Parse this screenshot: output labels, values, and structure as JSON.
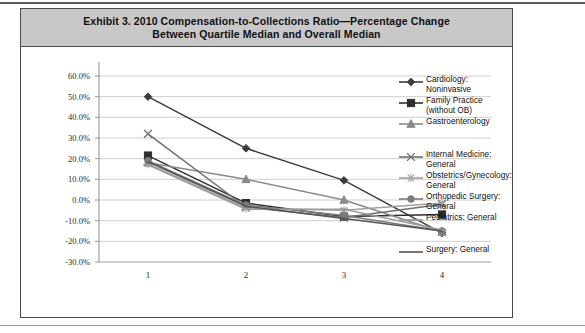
{
  "exhibit": {
    "title": "Exhibit 3. 2010 Compensation-to-Collections Ratio—Percentage Change Between Quartile Median and Overall Median",
    "title_line1": "Exhibit 3. 2010 Compensation-to-Collections Ratio—Percentage Change",
    "title_line2": "Between Quartile Median and Overall Median",
    "title_bar_color": "#c8c8c8",
    "border_color": "#4a4a4a"
  },
  "chart_data": {
    "type": "line",
    "title": "Exhibit 3. 2010 Compensation-to-Collections Ratio—Percentage Change Between Quartile Median and Overall Median",
    "xlabel": "",
    "ylabel": "",
    "x": [
      1,
      2,
      3,
      4
    ],
    "categories": [
      "1",
      "2",
      "3",
      "4"
    ],
    "xtick_labels": [
      "1",
      "2",
      "3",
      "4"
    ],
    "ytick_labels": [
      "60.0%",
      "50.0%",
      "40.0%",
      "30.0%",
      "20.0%",
      "10.0%",
      "0.0%",
      "-10.0%",
      "-20.0%",
      "-30.0%"
    ],
    "ytick_values": [
      60,
      50,
      40,
      30,
      20,
      10,
      0,
      -10,
      -20,
      -30
    ],
    "ylim": [
      -30,
      60
    ],
    "xlim": [
      0.5,
      4.5
    ],
    "grid": "horizontal",
    "legend_position": "right",
    "series": [
      {
        "name": "Cardiology: Noninvasive",
        "label_line1": "Cardiology:",
        "label_line2": "Noninvasive",
        "marker": "diamond",
        "color": "#3c3c3c",
        "values": [
          50.0,
          25.0,
          9.5,
          -16.0
        ]
      },
      {
        "name": "Family Practice (without OB)",
        "label_line1": "Family Practice",
        "label_line2": "(without OB)",
        "marker": "square",
        "color": "#2e2e2e",
        "values": [
          21.5,
          -1.5,
          -8.0,
          -7.0
        ]
      },
      {
        "name": "Gastroenterology",
        "label_line1": "Gastroenterology",
        "label_line2": "",
        "marker": "triangle",
        "color": "#8a8a8a",
        "values": [
          18.0,
          10.0,
          0.0,
          -15.5
        ]
      },
      {
        "name": "Internal Medicine: General",
        "label_line1": "Internal Medicine:",
        "label_line2": "General",
        "marker": "cross",
        "color": "#6f6f6f",
        "values": [
          32.0,
          -3.5,
          -8.5,
          -2.0
        ]
      },
      {
        "name": "Obstetrics/Gynecology: General",
        "label_line1": "Obstetrics/Gynecology:",
        "label_line2": "General",
        "marker": "asterisk",
        "color": "#a0a0a0",
        "values": [
          17.5,
          -4.0,
          -5.0,
          -1.5
        ]
      },
      {
        "name": "Orthopedic Surgery: General",
        "label_line1": "Orthopedic Surgery:",
        "label_line2": "General",
        "marker": "circle",
        "color": "#7b7b7b",
        "values": [
          19.0,
          -2.5,
          -7.5,
          -15.0
        ]
      },
      {
        "name": "Pediatrics: General",
        "label_line1": "Pediatrics: General",
        "label_line2": "",
        "marker": "line",
        "color": "#9b9b9b",
        "values": [
          17.0,
          -4.5,
          -4.5,
          -14.5
        ]
      },
      {
        "name": "Surgery: General",
        "label_line1": "Surgery: General",
        "label_line2": "",
        "marker": "none",
        "color": "#555555",
        "values": [
          18.5,
          -3.0,
          -9.0,
          -15.0
        ]
      }
    ]
  }
}
